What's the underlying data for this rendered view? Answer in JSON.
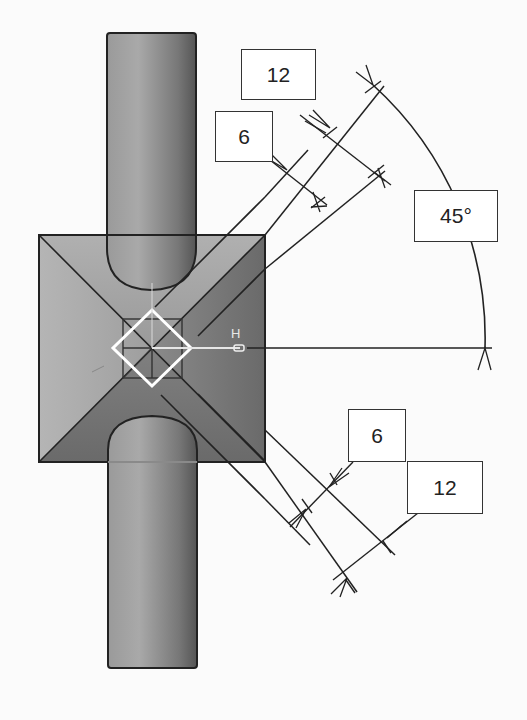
{
  "diagram": {
    "type": "technical-drawing",
    "colors": {
      "background": "#fbfbfb",
      "line": "#222222",
      "pad_light": "#b8b8b8",
      "pad_dark": "#6e6e6e",
      "cylinder_light": "#a8a8a8",
      "cylinder_dark": "#5a5a5a",
      "marker": "#ffffff"
    },
    "axis_label": "H",
    "dimensions": {
      "upper_inner": "6",
      "upper_outer": "12",
      "angle": "45°",
      "lower_inner": "6",
      "lower_outer": "12"
    }
  }
}
